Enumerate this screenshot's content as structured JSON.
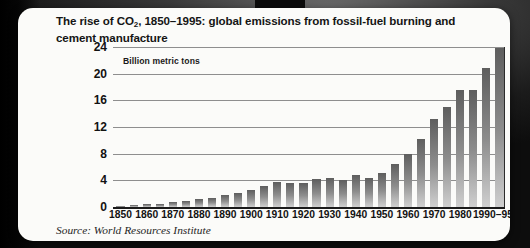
{
  "card": {
    "title_line1_pre": "The rise of CO",
    "title_sub": "2",
    "title_line1_post": ", 1850–1995: global emissions from fossil-fuel",
    "title_line2": "burning and cement manufacture",
    "axis_note": "Billion metric tons",
    "source": "Source: World Resources Institute"
  },
  "chart_data": {
    "type": "bar",
    "title": "The rise of CO2, 1850–1995: global emissions from fossil-fuel burning and cement manufacture",
    "subtitle": "",
    "xlabel": "",
    "ylabel": "Billion metric tons",
    "ylim": [
      0,
      24
    ],
    "yticks": [
      0,
      4,
      8,
      12,
      16,
      20,
      24
    ],
    "xtick_labels": [
      "1850",
      "1860",
      "1870",
      "1880",
      "1890",
      "1900",
      "1910",
      "1920",
      "1930",
      "1940",
      "1950",
      "1960",
      "1970",
      "1980",
      "1990–95"
    ],
    "grid": true,
    "legend": "none",
    "annotation": "Source: World Resources Institute",
    "bar_color": "#7d7d7d",
    "categories": [
      "1850",
      "1855",
      "1860",
      "1865",
      "1870",
      "1875",
      "1880",
      "1885",
      "1890",
      "1895",
      "1900",
      "1905",
      "1910",
      "1915",
      "1920",
      "1925",
      "1930",
      "1935",
      "1940",
      "1945",
      "1950",
      "1955",
      "1960",
      "1965",
      "1970",
      "1975",
      "1980",
      "1985",
      "1990",
      "1995"
    ],
    "values": [
      0.2,
      0.3,
      0.4,
      0.5,
      0.7,
      0.9,
      1.2,
      1.4,
      1.8,
      2.1,
      2.6,
      3.2,
      3.8,
      3.6,
      3.6,
      4.2,
      4.3,
      4.0,
      4.8,
      4.3,
      5.1,
      6.4,
      8.0,
      10.2,
      13.2,
      15.0,
      17.5,
      17.6,
      20.8,
      23.8
    ],
    "unit": "billion metric tons",
    "interval_years": 5
  }
}
